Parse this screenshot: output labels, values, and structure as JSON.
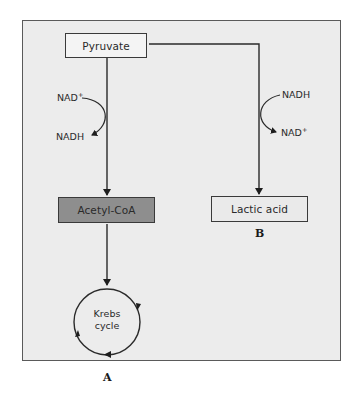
{
  "diagram": {
    "type": "metabolic-pathway",
    "colors": {
      "panel_background": "#ececec",
      "panel_border": "#5a5a5a",
      "line": "#2a2a2a",
      "acetyl_fill": "#8e8e8e",
      "node_fill": "#f4f4f4"
    },
    "nodes": {
      "pyruvate": "Pyruvate",
      "acetyl_coa": "Acetyl-CoA",
      "lactic_acid": "Lactic acid",
      "krebs_line1": "Krebs",
      "krebs_line2": "cycle"
    },
    "pathway_a": {
      "label": "A",
      "cofactor_in": "NAD",
      "cofactor_in_sup": "+",
      "cofactor_out": "NADH"
    },
    "pathway_b": {
      "label": "B",
      "cofactor_in": "NADH",
      "cofactor_out": "NAD",
      "cofactor_out_sup": "+"
    },
    "edges": [
      {
        "from": "Pyruvate",
        "to": "Acetyl-CoA"
      },
      {
        "from": "Pyruvate",
        "to": "Lactic acid"
      },
      {
        "from": "Acetyl-CoA",
        "to": "Krebs cycle"
      }
    ]
  }
}
